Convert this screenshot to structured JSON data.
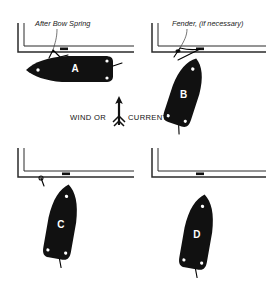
{
  "figure": {
    "background_color": "#ffffff",
    "ink_color": "#111111",
    "hull_color": "#111111",
    "dock_color": "#2b2b2b"
  },
  "annotations": {
    "after_bow_spring": "After Bow Spring",
    "fender": "Fender, (if necessary)",
    "flow_label_left": "WIND OR",
    "flow_label_right": "CURRENT",
    "flow_arrow_icon": "up-arrow-icon",
    "flow_direction": "up"
  },
  "panels": [
    {
      "id": "A",
      "letter": "A",
      "position": "top-left",
      "caption": "After Bow Spring",
      "boat_heading_degrees": 0,
      "boat_state": "alongside dock, spring line made fast",
      "has_fender": false,
      "attached_to_dock": true
    },
    {
      "id": "B",
      "letter": "B",
      "position": "top-right",
      "caption": "Fender, (if necessary)",
      "boat_heading_degrees": 70,
      "boat_state": "stern swung out, pivoting on bow spring",
      "has_fender": true,
      "attached_to_dock": true
    },
    {
      "id": "C",
      "letter": "C",
      "position": "bottom-left",
      "caption": "",
      "boat_heading_degrees": 80,
      "boat_state": "bow still held, boat nearly perpendicular",
      "has_fender": false,
      "attached_to_dock": true
    },
    {
      "id": "D",
      "letter": "D",
      "position": "bottom-right",
      "caption": "",
      "boat_heading_degrees": 80,
      "boat_state": "line cast off, boat clear of dock backing away",
      "has_fender": false,
      "attached_to_dock": false
    }
  ]
}
